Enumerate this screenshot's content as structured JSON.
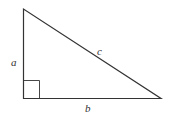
{
  "diagram": {
    "type": "right-triangle",
    "colors": {
      "stroke": "#333333",
      "background": "#ffffff"
    },
    "vertices": {
      "top": [
        23,
        9
      ],
      "right_angle": [
        24,
        98
      ],
      "right": [
        161,
        98
      ]
    },
    "labels": {
      "leg_vertical": "a",
      "leg_horizontal": "b",
      "hypotenuse": "c"
    },
    "right_angle_marker": true
  }
}
